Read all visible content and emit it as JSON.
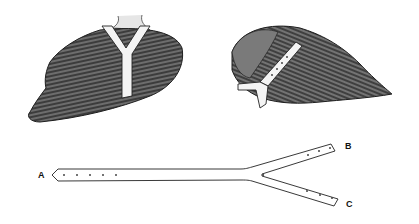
{
  "figure": {
    "colors": {
      "ink": "#1e1e1e",
      "feather_dark": "#3a3a3a",
      "feather_mid": "#6a6a6a",
      "strap": "#f4f4f4",
      "background": "#ffffff"
    }
  },
  "strap": {
    "labels": {
      "a": "A",
      "b": "B",
      "c": "C"
    },
    "holes": {
      "a": 5,
      "b": 3,
      "c": 3
    }
  }
}
